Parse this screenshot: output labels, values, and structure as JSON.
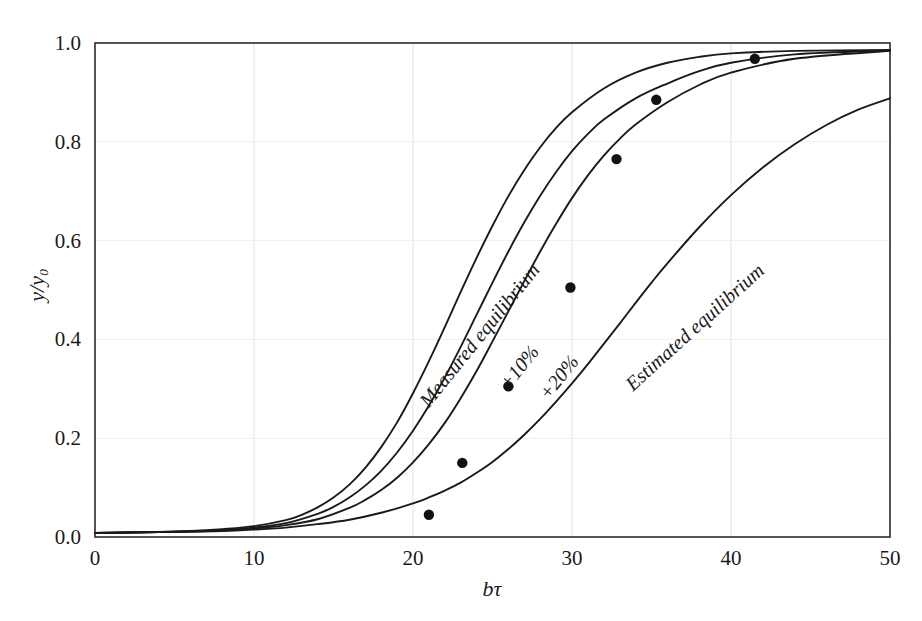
{
  "chart_data": {
    "type": "line",
    "title": "",
    "subtitle": "",
    "xlabel": "bτ",
    "ylabel": "y/y₀",
    "xlim": [
      0,
      50
    ],
    "ylim": [
      0.0,
      1.0
    ],
    "xticks": [
      0,
      10,
      20,
      30,
      40,
      50
    ],
    "xticklabels": [
      "0",
      "10",
      "20",
      "30",
      "40",
      "50"
    ],
    "yticks": [
      0.0,
      0.2,
      0.4,
      0.6,
      0.8,
      1.0
    ],
    "yticklabels": [
      "0.0",
      "0.2",
      "0.4",
      "0.6",
      "0.8",
      "1.0"
    ],
    "grid": true,
    "grid_color": "#f0f0f0",
    "legend": "inline-curve-labels",
    "line_color": "#1a1a1a",
    "marker_color": "#121212",
    "series": [
      {
        "name": "Measured equilibrium",
        "label_x": 24.5,
        "label_y": 0.4,
        "label_rotation": -51,
        "x": [
          0,
          2,
          4,
          6,
          8,
          10,
          12,
          13,
          14,
          15,
          16,
          17,
          18,
          19,
          20,
          21,
          22,
          23,
          24,
          25,
          26,
          27,
          28,
          29,
          30,
          32,
          34,
          36,
          38,
          40,
          44,
          50
        ],
        "y": [
          0.008,
          0.009,
          0.01,
          0.012,
          0.016,
          0.022,
          0.034,
          0.045,
          0.06,
          0.08,
          0.106,
          0.14,
          0.182,
          0.232,
          0.291,
          0.356,
          0.425,
          0.496,
          0.565,
          0.63,
          0.69,
          0.743,
          0.789,
          0.828,
          0.86,
          0.908,
          0.94,
          0.96,
          0.972,
          0.979,
          0.984,
          0.986
        ]
      },
      {
        "name": "+10%",
        "label_x": 27.0,
        "label_y": 0.335,
        "label_rotation": -51,
        "x": [
          0,
          2,
          4,
          6,
          8,
          10,
          12,
          14,
          15,
          16,
          17,
          18,
          19,
          20,
          21,
          22,
          23,
          24,
          25,
          26,
          27,
          28,
          29,
          30,
          31,
          32,
          34,
          36,
          38,
          40,
          44,
          50
        ],
        "y": [
          0.008,
          0.009,
          0.01,
          0.011,
          0.014,
          0.019,
          0.028,
          0.047,
          0.061,
          0.08,
          0.104,
          0.134,
          0.171,
          0.215,
          0.266,
          0.323,
          0.385,
          0.45,
          0.515,
          0.578,
          0.637,
          0.691,
          0.739,
          0.781,
          0.816,
          0.845,
          0.888,
          0.918,
          0.943,
          0.96,
          0.977,
          0.985
        ]
      },
      {
        "name": "+20%",
        "label_x": 29.5,
        "label_y": 0.315,
        "label_rotation": -51,
        "x": [
          0,
          2,
          4,
          6,
          8,
          10,
          12,
          14,
          16,
          17,
          18,
          19,
          20,
          21,
          22,
          23,
          24,
          25,
          26,
          27,
          28,
          29,
          30,
          31,
          32,
          33,
          34,
          36,
          38,
          40,
          44,
          50
        ],
        "y": [
          0.008,
          0.009,
          0.01,
          0.011,
          0.013,
          0.017,
          0.024,
          0.036,
          0.059,
          0.075,
          0.095,
          0.12,
          0.151,
          0.188,
          0.231,
          0.281,
          0.336,
          0.396,
          0.457,
          0.518,
          0.578,
          0.634,
          0.686,
          0.732,
          0.772,
          0.806,
          0.835,
          0.88,
          0.915,
          0.94,
          0.968,
          0.984
        ]
      },
      {
        "name": "Estimated equilibrium",
        "label_x": 38.0,
        "label_y": 0.415,
        "label_rotation": -42,
        "x": [
          0,
          2,
          4,
          6,
          8,
          10,
          12,
          14,
          16,
          18,
          20,
          21,
          22,
          23,
          24,
          25,
          26,
          27,
          28,
          29,
          30,
          31,
          32,
          33,
          34,
          35,
          36,
          38,
          40,
          42,
          44,
          46,
          48,
          50
        ],
        "y": [
          0.008,
          0.009,
          0.01,
          0.011,
          0.012,
          0.015,
          0.019,
          0.026,
          0.035,
          0.049,
          0.068,
          0.08,
          0.094,
          0.11,
          0.13,
          0.152,
          0.178,
          0.207,
          0.239,
          0.274,
          0.311,
          0.35,
          0.391,
          0.432,
          0.474,
          0.515,
          0.554,
          0.627,
          0.692,
          0.748,
          0.795,
          0.834,
          0.865,
          0.888
        ]
      }
    ],
    "scatter": {
      "name": "Measured data points",
      "marker": "filled-circle",
      "points": [
        {
          "x": 21.0,
          "y": 0.045
        },
        {
          "x": 23.1,
          "y": 0.15
        },
        {
          "x": 26.0,
          "y": 0.305
        },
        {
          "x": 29.9,
          "y": 0.505
        },
        {
          "x": 32.8,
          "y": 0.765
        },
        {
          "x": 35.3,
          "y": 0.885
        },
        {
          "x": 41.5,
          "y": 0.968
        }
      ]
    }
  }
}
